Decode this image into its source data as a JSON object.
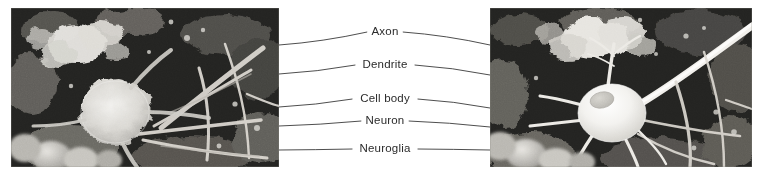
{
  "figure": {
    "background_color": "#ffffff",
    "leader_line_color": "#3a3a3a",
    "label_text_color": "#2b2b2b",
    "width": 764,
    "height": 179
  },
  "panels": [
    {
      "id": "left-micrograph",
      "name": "left-electron-micrograph",
      "description": "Scanning electron micrograph of a neuron cell body surrounded by neuroglia and processes",
      "x": 11,
      "y": 8,
      "width": 268,
      "height": 159
    },
    {
      "id": "right-micrograph",
      "name": "right-electron-micrograph",
      "description": "Scanning electron micrograph showing the neuron cell body, dendrites and a long axon",
      "x": 490,
      "y": 8,
      "width": 262,
      "height": 159
    }
  ],
  "labels": [
    {
      "text": "Axon",
      "name": "label-axon",
      "x": 385,
      "y": 32,
      "left_anchor_x": 279,
      "left_anchor_y": 45,
      "right_anchor_x": 490,
      "right_anchor_y": 45
    },
    {
      "text": "Dendrite",
      "name": "label-dendrite",
      "x": 385,
      "y": 65,
      "left_anchor_x": 279,
      "left_anchor_y": 74,
      "right_anchor_x": 490,
      "right_anchor_y": 75
    },
    {
      "text": "Cell body",
      "name": "label-cell-body",
      "x": 385,
      "y": 99,
      "left_anchor_x": 279,
      "left_anchor_y": 107,
      "right_anchor_x": 490,
      "right_anchor_y": 108
    },
    {
      "text": "Neuron",
      "name": "label-neuron",
      "x": 385,
      "y": 121,
      "left_anchor_x": 279,
      "left_anchor_y": 126,
      "right_anchor_x": 490,
      "right_anchor_y": 127
    },
    {
      "text": "Neuroglia",
      "name": "label-neuroglia",
      "x": 385,
      "y": 149,
      "left_anchor_x": 279,
      "left_anchor_y": 150,
      "right_anchor_x": 490,
      "right_anchor_y": 150
    }
  ]
}
